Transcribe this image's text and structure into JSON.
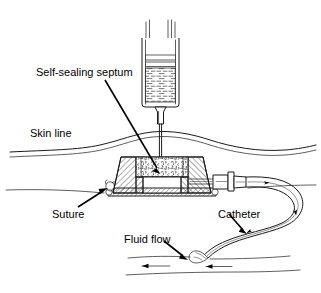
{
  "figure": {
    "background_color": "#ffffff",
    "ink_color": "#1a1a1a",
    "width": 321,
    "height": 293
  },
  "labels": {
    "septum": "Self-sealing septum",
    "skin_line": "Skin line",
    "suture": "Suture",
    "catheter": "Catheter",
    "fluid_flow": "Fluid flow"
  },
  "parts": {
    "syringe": "syringe-barrel",
    "plunger": "syringe-plunger",
    "fluid": "syringe-fluid",
    "needle": "needle",
    "skin": "skin-line-contour",
    "port_body": "port-housing",
    "septum_region": "self-sealing-septum",
    "reservoir": "port-reservoir-chamber",
    "base_plate": "port-base-plate",
    "suture_loop": "suture-loop",
    "connector": "catheter-connector-stem",
    "catheter_tube": "catheter-tubing",
    "vessel": "blood-vessel",
    "flow_arrows": "fluid-flow-arrows"
  }
}
